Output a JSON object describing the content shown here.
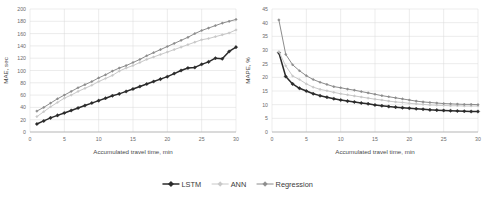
{
  "figure": {
    "background": "#ffffff",
    "panel_count": 2
  },
  "legend": {
    "position": "bottom-center",
    "entries": [
      {
        "label": "LSTM",
        "color": "#2b2b2b",
        "marker": "diamond"
      },
      {
        "label": "ANN",
        "color": "#c8c8c8",
        "marker": "diamond"
      },
      {
        "label": "Regression",
        "color": "#8c8c8c",
        "marker": "diamond"
      }
    ]
  },
  "chart_data": [
    {
      "type": "line",
      "panel": "left",
      "title": "",
      "xlabel": "Accumulated travel time, min",
      "ylabel": "MAE, sec",
      "xlim": [
        0,
        30
      ],
      "ylim": [
        0,
        200
      ],
      "xticks": [
        0,
        5,
        10,
        15,
        20,
        25,
        30
      ],
      "yticks": [
        0,
        20,
        40,
        60,
        80,
        100,
        120,
        140,
        160,
        180,
        200
      ],
      "grid": "horizontal-and-vertical",
      "x": [
        1,
        2,
        3,
        4,
        5,
        6,
        7,
        8,
        9,
        10,
        11,
        12,
        13,
        14,
        15,
        16,
        17,
        18,
        19,
        20,
        21,
        22,
        23,
        24,
        25,
        26,
        27,
        28,
        29,
        30
      ],
      "series": [
        {
          "name": "LSTM",
          "color": "#2b2b2b",
          "values": [
            13,
            18,
            23,
            27,
            31,
            35,
            39,
            43,
            47,
            51,
            55,
            59,
            62,
            66,
            70,
            74,
            78,
            82,
            86,
            90,
            95,
            100,
            104,
            105,
            110,
            114,
            120,
            119,
            131,
            138
          ]
        },
        {
          "name": "ANN",
          "color": "#c8c8c8",
          "values": [
            25,
            33,
            41,
            48,
            55,
            60,
            66,
            71,
            76,
            82,
            87,
            92,
            99,
            104,
            108,
            113,
            118,
            122,
            126,
            130,
            134,
            138,
            142,
            146,
            150,
            152,
            155,
            158,
            161,
            166
          ]
        },
        {
          "name": "Regression",
          "color": "#8c8c8c",
          "values": [
            34,
            40,
            47,
            54,
            60,
            66,
            72,
            77,
            82,
            88,
            93,
            99,
            104,
            108,
            113,
            118,
            124,
            129,
            134,
            139,
            144,
            149,
            154,
            160,
            165,
            169,
            173,
            177,
            180,
            183
          ]
        }
      ]
    },
    {
      "type": "line",
      "panel": "right",
      "title": "",
      "xlabel": "Accumulated travel time, min",
      "ylabel": "MAPE, %",
      "xlim": [
        0,
        30
      ],
      "ylim": [
        0,
        45
      ],
      "xticks": [
        0,
        5,
        10,
        15,
        20,
        25,
        30
      ],
      "yticks": [
        0,
        5,
        10,
        15,
        20,
        25,
        30,
        35,
        40,
        45
      ],
      "grid": "horizontal-and-vertical",
      "x": [
        1,
        2,
        3,
        4,
        5,
        6,
        7,
        8,
        9,
        10,
        11,
        12,
        13,
        14,
        15,
        16,
        17,
        18,
        19,
        20,
        21,
        22,
        23,
        24,
        25,
        26,
        27,
        28,
        29,
        30
      ],
      "series": [
        {
          "name": "LSTM",
          "color": "#2b2b2b",
          "values": [
            29.0,
            20.3,
            17.6,
            16.0,
            15.0,
            14.0,
            13.3,
            12.7,
            12.2,
            11.7,
            11.3,
            11.0,
            10.6,
            10.3,
            9.9,
            9.6,
            9.3,
            9.1,
            8.9,
            8.7,
            8.5,
            8.3,
            8.1,
            8.0,
            7.9,
            7.8,
            7.7,
            7.6,
            7.5,
            7.5
          ]
        },
        {
          "name": "ANN",
          "color": "#c8c8c8",
          "values": [
            29.4,
            24.2,
            20.5,
            19.2,
            17.6,
            16.4,
            15.6,
            15.1,
            14.5,
            14.0,
            13.6,
            13.2,
            12.8,
            12.4,
            12.0,
            11.7,
            11.3,
            11.0,
            10.8,
            10.5,
            10.3,
            10.1,
            9.9,
            9.8,
            9.7,
            9.6,
            9.6,
            9.5,
            9.5,
            9.5
          ]
        },
        {
          "name": "Regression",
          "color": "#8c8c8c",
          "values": [
            41.0,
            28.4,
            24.6,
            22.4,
            20.6,
            19.2,
            18.2,
            17.4,
            16.6,
            16.2,
            15.7,
            15.3,
            14.8,
            14.3,
            13.8,
            13.3,
            12.9,
            12.5,
            12.1,
            11.7,
            11.3,
            11.0,
            10.8,
            10.6,
            10.4,
            10.3,
            10.2,
            10.1,
            10.1,
            10.0
          ]
        }
      ]
    }
  ]
}
